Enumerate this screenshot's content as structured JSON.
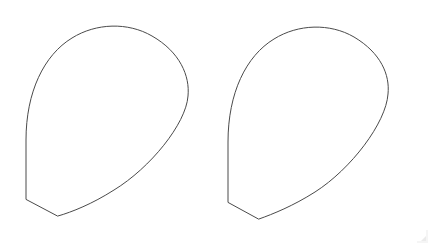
{
  "canvas": {
    "width": 430,
    "height": 245,
    "background_color": "#ffffff",
    "has_border": false
  },
  "style": {
    "stroke_color": "#4a4a4a",
    "stroke_width": 1,
    "fill": "none",
    "artifact_color": "#dcdcdc"
  },
  "figure": {
    "shape_count": 2,
    "shapes": [
      {
        "name": "left-petal",
        "label": "left teardrop outline",
        "top_apex": [
          118,
          27
        ],
        "right_bulge": [
          188,
          95
        ],
        "bottom_apex": [
          58,
          216
        ],
        "left_notch_corner": [
          26,
          199
        ],
        "path": "M 26 199 L 26 140 C 26 92 44 55 72 38 C 96 23 128 22 152 36 C 180 52 190 76 188 96 C 186 124 150 168 114 190 C 92 204 72 212 58 216 Z"
      },
      {
        "name": "right-petal",
        "label": "right teardrop outline",
        "top_apex": [
          318,
          27
        ],
        "right_bulge": [
          388,
          92
        ],
        "bottom_apex": [
          259,
          219
        ],
        "left_notch_corner": [
          228,
          202
        ],
        "path": "M 228 202 L 228 142 C 228 93 246 56 274 39 C 298 24 330 23 354 37 C 381 53 390 75 388 94 C 386 123 351 169 315 192 C 293 206 273 214 259 219 Z"
      }
    ],
    "artifact": {
      "name": "corner-smudge",
      "x": 414,
      "y": 229,
      "width": 14,
      "height": 14
    }
  }
}
